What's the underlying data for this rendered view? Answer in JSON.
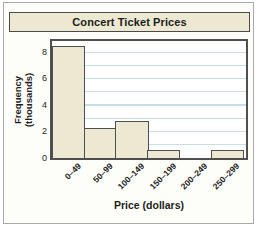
{
  "figure": {
    "title": "Concert Ticket Prices",
    "xlabel": "Price (dollars)",
    "ylabel_line1": "Frequency",
    "ylabel_line2": "(thousands)"
  },
  "chart_data": {
    "type": "bar",
    "title": "Concert Ticket Prices",
    "categories": [
      "0–49",
      "50–99",
      "100–149",
      "150–199",
      "200–249",
      "250–299"
    ],
    "values": [
      8.5,
      2.3,
      2.8,
      0.6,
      0,
      0.6
    ],
    "xlabel": "Price (dollars)",
    "ylabel": "Frequency (thousands)",
    "yticks": [
      0,
      2,
      4,
      6,
      8
    ],
    "ylim": [
      0,
      8.85
    ],
    "grid": "horizontal",
    "grid_step": 1,
    "legend": "none",
    "bar_style": "histogram-contiguous"
  },
  "colors": {
    "bar_fill": "#ece8d1",
    "bar_border": "#4f4f4f",
    "grid_line": "#c6dee9",
    "title_bg": "#ece8d1",
    "frame_border": "#a9a9a9",
    "text": "#1d1d1d"
  }
}
